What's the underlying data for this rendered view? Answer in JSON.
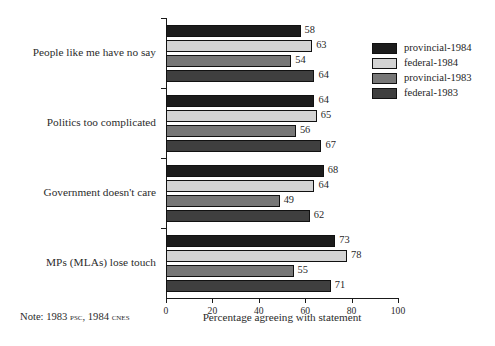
{
  "chart_data": {
    "type": "bar",
    "orientation": "horizontal",
    "title": "",
    "xlabel": "Percentage agreeing with statement",
    "ylabel": "",
    "xlim": [
      0,
      100
    ],
    "xticks": [
      0,
      20,
      40,
      60,
      80,
      100
    ],
    "xticklabels": [
      "0",
      "20",
      "40",
      "60",
      "80",
      "100"
    ],
    "grid": false,
    "legend_position": "right",
    "categories": [
      "People like me have no say",
      "Politics too complicated",
      "Government doesn't care",
      "MPs (MLAs) lose touch"
    ],
    "series": [
      {
        "name": "provincial-1984",
        "color": "#1c1c1c",
        "values": [
          58,
          64,
          68,
          73
        ]
      },
      {
        "name": "federal-1984",
        "color": "#d3d3d3",
        "values": [
          63,
          65,
          64,
          78
        ]
      },
      {
        "name": "provincial-1983",
        "color": "#777777",
        "values": [
          54,
          56,
          49,
          55
        ]
      },
      {
        "name": "federal-1983",
        "color": "#3f3f3f",
        "values": [
          64,
          67,
          62,
          71
        ]
      }
    ],
    "annotations": {
      "note": "Note: 1983 PSC, 1984 CNES",
      "note_prefix": "Note: 1983 ",
      "note_sc1": "psc",
      "note_mid": ", 1984 ",
      "note_sc2": "cnes"
    }
  },
  "category_labels": [
    {
      "text": "People like me have no say",
      "smallcaps_parts": null
    },
    {
      "text": "Politics too complicated",
      "smallcaps_parts": null
    },
    {
      "text": "Government doesn't care",
      "smallcaps_parts": null
    },
    {
      "text": "MPs (MLAs) lose touch",
      "sc_a": "MP",
      "plain_a": "s (",
      "sc_b": "MLA",
      "plain_b": "s) lose touch"
    }
  ],
  "legend": {
    "items": [
      {
        "label": "provincial-1984",
        "color": "#1c1c1c"
      },
      {
        "label": "federal-1984",
        "color": "#d3d3d3"
      },
      {
        "label": "provincial-1983",
        "color": "#777777"
      },
      {
        "label": "federal-1983",
        "color": "#3f3f3f"
      }
    ]
  },
  "colors": {
    "background": "#ffffff",
    "axis": "#1a1a1a",
    "text": "#1f1f1f"
  }
}
